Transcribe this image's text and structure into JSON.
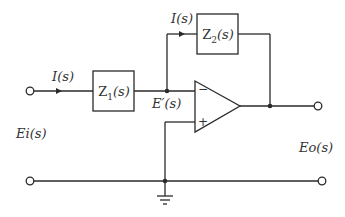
{
  "diagram": {
    "type": "inverting-op-amp-circuit",
    "components": {
      "z1": {
        "label": "Z1(s)",
        "main": "Z",
        "sub": "1",
        "arg": "(s)"
      },
      "z2": {
        "label": "Z2(s)",
        "main": "Z",
        "sub": "2",
        "arg": "(s)"
      },
      "opamp": {
        "inverting_sign": "−",
        "noninverting_sign": "+"
      }
    },
    "labels": {
      "input_current": "I(s)",
      "feedback_current": "I(s)",
      "node_voltage": "E′(s)",
      "input_voltage": "Ei(s)",
      "output_voltage": "Eo(s)"
    },
    "colors": {
      "line": "#2a2a2a",
      "text": "#333333",
      "background": "#ffffff"
    }
  }
}
